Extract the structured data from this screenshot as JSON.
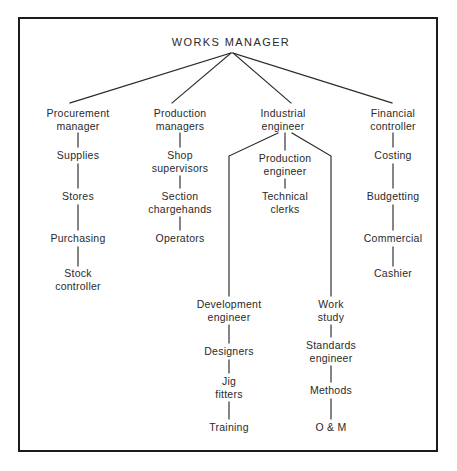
{
  "diagram": {
    "type": "organisation-chart",
    "title": "WORKS MANAGER",
    "frame": {
      "border_color": "#1c1c1c",
      "background": "#ffffff"
    },
    "line_color": "#2a2a2a",
    "nodes": [
      {
        "id": "works-manager",
        "label": "WORKS MANAGER",
        "x": 231,
        "y": 42,
        "level": 0
      },
      {
        "id": "procurement-manager",
        "label": "Procurement\nmanager",
        "x": 78,
        "y": 113,
        "level": 1
      },
      {
        "id": "supplies",
        "label": "Supplies",
        "x": 78,
        "y": 155,
        "level": 2
      },
      {
        "id": "stores",
        "label": "Stores",
        "x": 78,
        "y": 196,
        "level": 3
      },
      {
        "id": "purchasing",
        "label": "Purchasing",
        "x": 78,
        "y": 238,
        "level": 4
      },
      {
        "id": "stock-controller",
        "label": "Stock\ncontroller",
        "x": 78,
        "y": 273,
        "level": 5
      },
      {
        "id": "production-managers",
        "label": "Production\nmanagers",
        "x": 180,
        "y": 113,
        "level": 1
      },
      {
        "id": "shop-supervisors",
        "label": "Shop\nsupervisors",
        "x": 180,
        "y": 155,
        "level": 2
      },
      {
        "id": "section-chargehands",
        "label": "Section\nchargehands",
        "x": 180,
        "y": 196,
        "level": 3
      },
      {
        "id": "operators",
        "label": "Operators",
        "x": 180,
        "y": 238,
        "level": 4
      },
      {
        "id": "industrial-engineer",
        "label": "Industrial\nengineer",
        "x": 283,
        "y": 113,
        "level": 1
      },
      {
        "id": "production-engineer",
        "label": "Production\nengineer",
        "x": 285,
        "y": 158,
        "level": 2
      },
      {
        "id": "technical-clerks",
        "label": "Technical\nclerks",
        "x": 285,
        "y": 196,
        "level": 3
      },
      {
        "id": "development-engineer",
        "label": "Development\nengineer",
        "x": 229,
        "y": 304,
        "level": 2
      },
      {
        "id": "designers",
        "label": "Designers",
        "x": 229,
        "y": 351,
        "level": 3
      },
      {
        "id": "jig-fitters",
        "label": "Jig\nfitters",
        "x": 229,
        "y": 381,
        "level": 4
      },
      {
        "id": "training",
        "label": "Training",
        "x": 229,
        "y": 427,
        "level": 5
      },
      {
        "id": "work-study",
        "label": "Work\nstudy",
        "x": 331,
        "y": 304,
        "level": 2
      },
      {
        "id": "standards-engineer",
        "label": "Standards\nengineer",
        "x": 331,
        "y": 345,
        "level": 3
      },
      {
        "id": "methods",
        "label": "Methods",
        "x": 331,
        "y": 390,
        "level": 4
      },
      {
        "id": "o-and-m",
        "label": "O & M",
        "x": 331,
        "y": 427,
        "level": 5
      },
      {
        "id": "financial-controller",
        "label": "Financial\ncontroller",
        "x": 393,
        "y": 113,
        "level": 1
      },
      {
        "id": "costing",
        "label": "Costing",
        "x": 393,
        "y": 155,
        "level": 2
      },
      {
        "id": "budgetting",
        "label": "Budgetting",
        "x": 393,
        "y": 196,
        "level": 3
      },
      {
        "id": "commercial",
        "label": "Commercial",
        "x": 393,
        "y": 238,
        "level": 4
      },
      {
        "id": "cashier",
        "label": "Cashier",
        "x": 393,
        "y": 273,
        "level": 5
      }
    ],
    "edges": [
      {
        "from": "works-manager",
        "to": "procurement-manager"
      },
      {
        "from": "works-manager",
        "to": "production-managers"
      },
      {
        "from": "works-manager",
        "to": "industrial-engineer"
      },
      {
        "from": "works-manager",
        "to": "financial-controller"
      },
      {
        "from": "procurement-manager",
        "to": "supplies"
      },
      {
        "from": "supplies",
        "to": "stores"
      },
      {
        "from": "stores",
        "to": "purchasing"
      },
      {
        "from": "purchasing",
        "to": "stock-controller"
      },
      {
        "from": "production-managers",
        "to": "shop-supervisors"
      },
      {
        "from": "shop-supervisors",
        "to": "section-chargehands"
      },
      {
        "from": "section-chargehands",
        "to": "operators"
      },
      {
        "from": "industrial-engineer",
        "to": "production-engineer"
      },
      {
        "from": "production-engineer",
        "to": "technical-clerks"
      },
      {
        "from": "industrial-engineer",
        "to": "development-engineer"
      },
      {
        "from": "industrial-engineer",
        "to": "work-study"
      },
      {
        "from": "development-engineer",
        "to": "designers"
      },
      {
        "from": "designers",
        "to": "jig-fitters"
      },
      {
        "from": "jig-fitters",
        "to": "training"
      },
      {
        "from": "work-study",
        "to": "standards-engineer"
      },
      {
        "from": "standards-engineer",
        "to": "methods"
      },
      {
        "from": "methods",
        "to": "o-and-m"
      },
      {
        "from": "financial-controller",
        "to": "costing"
      },
      {
        "from": "costing",
        "to": "budgetting"
      },
      {
        "from": "budgetting",
        "to": "commercial"
      },
      {
        "from": "commercial",
        "to": "cashier"
      }
    ]
  }
}
